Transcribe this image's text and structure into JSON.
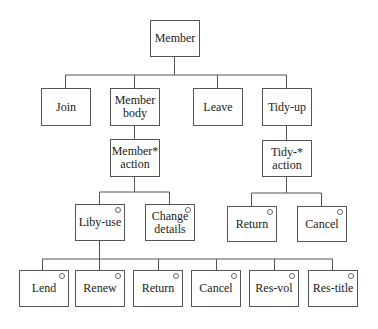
{
  "diagram": {
    "root": {
      "label": "Member"
    },
    "level1": [
      {
        "label": "Join"
      },
      {
        "label": "Member\nbody"
      },
      {
        "label": "Leave"
      },
      {
        "label": "Tidy-up"
      }
    ],
    "level2": [
      {
        "label": "Member*\naction",
        "iteration": true
      },
      {
        "label": "Tidy-*\naction",
        "iteration": true
      }
    ],
    "member_action_children": [
      {
        "label": "Liby-use",
        "selection": true
      },
      {
        "label": "Change\ndetails",
        "selection": true
      }
    ],
    "tidy_action_children": [
      {
        "label": "Return",
        "selection": true
      },
      {
        "label": "Cancel",
        "selection": true
      }
    ],
    "liby_use_children": [
      {
        "label": "Lend",
        "selection": true
      },
      {
        "label": "Renew",
        "selection": true
      },
      {
        "label": "Return",
        "selection": true
      },
      {
        "label": "Cancel",
        "selection": true
      },
      {
        "label": "Res-vol",
        "selection": true
      },
      {
        "label": "Res-title",
        "selection": true
      }
    ]
  }
}
